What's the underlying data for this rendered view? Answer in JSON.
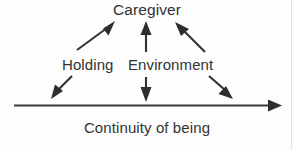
{
  "diagram": {
    "title_text": "Caregiver",
    "mid_left_text": "Holding",
    "mid_right_text": "Environment",
    "axis_caption": "Continuity of being",
    "ink_color": "#333333",
    "background_color": "#fdfdfd",
    "axis": {
      "start_x": 14,
      "end_x": 276,
      "y": 105,
      "has_left_arrowhead": false,
      "has_right_arrowhead": true,
      "direction": "rightward"
    },
    "arrows_up": [
      {
        "name": "holding-to-caregiver",
        "from_x": 76,
        "from_y": 50,
        "to_x": 110,
        "to_y": 25,
        "direction": "up-right"
      },
      {
        "name": "environment-to-caregiver",
        "from_x": 146,
        "from_y": 52,
        "to_x": 146,
        "to_y": 23,
        "direction": "up"
      },
      {
        "name": "right-support-to-caregiver",
        "from_x": 205,
        "from_y": 52,
        "to_x": 179,
        "to_y": 24,
        "direction": "up-left"
      }
    ],
    "arrows_down": [
      {
        "name": "holding-to-continuity",
        "from_x": 70,
        "from_y": 75,
        "to_x": 54,
        "to_y": 100,
        "direction": "down-left"
      },
      {
        "name": "environment-to-continuity",
        "from_x": 146,
        "from_y": 77,
        "to_x": 146,
        "to_y": 101,
        "direction": "down"
      },
      {
        "name": "right-support-to-continuity",
        "from_x": 210,
        "from_y": 75,
        "to_x": 232,
        "to_y": 100,
        "direction": "down-right"
      }
    ]
  }
}
